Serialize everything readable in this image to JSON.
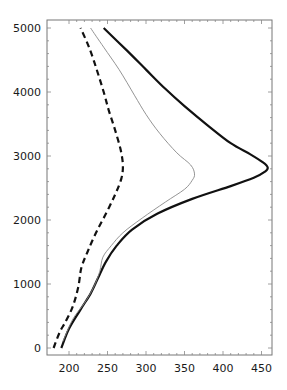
{
  "chart_data": {
    "type": "line",
    "title": "",
    "xlabel": "",
    "ylabel": "",
    "xlim": [
      178,
      465
    ],
    "ylim": [
      -100,
      5100
    ],
    "x_ticks": [
      200,
      250,
      300,
      350,
      400,
      450
    ],
    "y_ticks": [
      0,
      1000,
      2000,
      3000,
      4000,
      5000
    ],
    "grid": false,
    "legend": null,
    "series": [
      {
        "name": "thick-solid",
        "style": "solid",
        "width": 2.2,
        "color": "#111111",
        "points": [
          [
            190,
            0
          ],
          [
            200,
            300
          ],
          [
            215,
            600
          ],
          [
            228,
            850
          ],
          [
            238,
            1100
          ],
          [
            248,
            1350
          ],
          [
            262,
            1600
          ],
          [
            282,
            1850
          ],
          [
            315,
            2100
          ],
          [
            360,
            2330
          ],
          [
            410,
            2530
          ],
          [
            440,
            2660
          ],
          [
            455,
            2760
          ],
          [
            458,
            2820
          ],
          [
            452,
            2900
          ],
          [
            435,
            3030
          ],
          [
            410,
            3200
          ],
          [
            380,
            3480
          ],
          [
            350,
            3780
          ],
          [
            325,
            4050
          ],
          [
            300,
            4350
          ],
          [
            275,
            4650
          ],
          [
            245,
            5000
          ]
        ]
      },
      {
        "name": "thin-gray",
        "style": "solid",
        "width": 0.9,
        "color": "#888888",
        "points": [
          [
            192,
            100
          ],
          [
            205,
            450
          ],
          [
            220,
            700
          ],
          [
            232,
            950
          ],
          [
            240,
            1200
          ],
          [
            244,
            1420
          ],
          [
            255,
            1600
          ],
          [
            270,
            1800
          ],
          [
            295,
            2030
          ],
          [
            325,
            2280
          ],
          [
            350,
            2480
          ],
          [
            360,
            2620
          ],
          [
            363,
            2720
          ],
          [
            358,
            2860
          ],
          [
            340,
            3050
          ],
          [
            318,
            3350
          ],
          [
            300,
            3650
          ],
          [
            285,
            3950
          ],
          [
            265,
            4350
          ],
          [
            245,
            4700
          ],
          [
            228,
            5000
          ]
        ]
      },
      {
        "name": "dashed",
        "style": "dashed",
        "width": 2.2,
        "color": "#111111",
        "points": [
          [
            180,
            0
          ],
          [
            188,
            250
          ],
          [
            195,
            400
          ],
          [
            205,
            650
          ],
          [
            212,
            950
          ],
          [
            216,
            1250
          ],
          [
            224,
            1500
          ],
          [
            235,
            1800
          ],
          [
            248,
            2100
          ],
          [
            260,
            2400
          ],
          [
            268,
            2650
          ],
          [
            270,
            2850
          ],
          [
            267,
            3100
          ],
          [
            260,
            3400
          ],
          [
            252,
            3700
          ],
          [
            245,
            4000
          ],
          [
            236,
            4350
          ],
          [
            226,
            4700
          ],
          [
            215,
            5000
          ]
        ]
      }
    ]
  }
}
